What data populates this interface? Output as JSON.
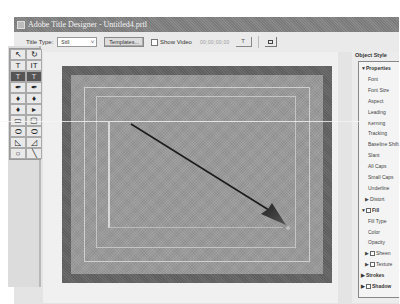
{
  "window": {
    "title": "Adobe Title Designer - Untitled4.prtl"
  },
  "toolbar": {
    "title_type_label": "Title Type:",
    "title_type_value": "Still",
    "templates_button": "Templates...",
    "show_video_label": "Show Video",
    "show_video_checked": false,
    "timecode": "00;00;00;00",
    "small_button_label": "T"
  },
  "tools": [
    {
      "name": "selection-tool",
      "glyph": "↖",
      "selected": false
    },
    {
      "name": "rotate-tool",
      "glyph": "↻",
      "selected": false
    },
    {
      "name": "type-tool",
      "glyph": "T",
      "selected": false
    },
    {
      "name": "vertical-type-tool",
      "glyph": "IT",
      "selected": false
    },
    {
      "name": "area-type-tool",
      "glyph": "T",
      "selected": true
    },
    {
      "name": "vertical-area-type-tool",
      "glyph": "T",
      "selected": true
    },
    {
      "name": "path-type-tool",
      "glyph": "✒",
      "selected": false
    },
    {
      "name": "vertical-path-type-tool",
      "glyph": "✒",
      "selected": false
    },
    {
      "name": "pen-tool",
      "glyph": "♦",
      "selected": false
    },
    {
      "name": "add-anchor-tool",
      "glyph": "♦",
      "selected": false
    },
    {
      "name": "delete-anchor-tool",
      "glyph": "♦",
      "selected": false
    },
    {
      "name": "convert-anchor-tool",
      "glyph": "▸",
      "selected": false
    },
    {
      "name": "rectangle-tool",
      "glyph": "▭",
      "selected": false
    },
    {
      "name": "rounded-corner-rect-tool",
      "glyph": "▢",
      "selected": false
    },
    {
      "name": "clipped-corner-rect-tool",
      "glyph": "⬭",
      "selected": false
    },
    {
      "name": "rounded-rect-tool",
      "glyph": "⬭",
      "selected": false
    },
    {
      "name": "wedge-tool",
      "glyph": "◺",
      "selected": false
    },
    {
      "name": "arc-tool",
      "glyph": "◿",
      "selected": false
    },
    {
      "name": "ellipse-tool",
      "glyph": "○",
      "selected": false
    },
    {
      "name": "line-tool",
      "glyph": "╲",
      "selected": false
    }
  ],
  "panel": {
    "title": "Object Style",
    "rows": [
      {
        "kind": "head",
        "tri": "▼",
        "label": "Properties"
      },
      {
        "kind": "item",
        "label": "Font"
      },
      {
        "kind": "item",
        "label": "Font Size"
      },
      {
        "kind": "item",
        "label": "Aspect"
      },
      {
        "kind": "item",
        "label": "Leading"
      },
      {
        "kind": "item",
        "label": "Kerning"
      },
      {
        "kind": "item",
        "label": "Tracking"
      },
      {
        "kind": "item",
        "label": "Baseline Shift"
      },
      {
        "kind": "item",
        "label": "Slant"
      },
      {
        "kind": "item",
        "label": "All Caps"
      },
      {
        "kind": "item",
        "label": "Small Caps"
      },
      {
        "kind": "item",
        "label": "Underline"
      },
      {
        "kind": "sub",
        "tri": "▶",
        "label": "Distort"
      },
      {
        "kind": "headcb",
        "tri": "▼",
        "label": "Fill",
        "checked": true
      },
      {
        "kind": "item",
        "label": "Fill Type"
      },
      {
        "kind": "item",
        "label": "Color"
      },
      {
        "kind": "item",
        "label": "Opacity"
      },
      {
        "kind": "subcb",
        "tri": "▶",
        "label": "Sheen"
      },
      {
        "kind": "subcb",
        "tri": "▶",
        "label": "Texture"
      },
      {
        "kind": "head",
        "tri": "▶",
        "label": "Strokes"
      },
      {
        "kind": "headcb",
        "tri": "▶",
        "label": "Shadow",
        "checked": false
      }
    ]
  },
  "canvas": {
    "object": "arrow-line",
    "arrow_start": [
      118,
      125
    ],
    "arrow_end": [
      286,
      226
    ]
  }
}
